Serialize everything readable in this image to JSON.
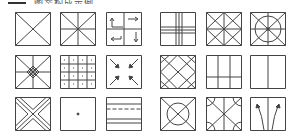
{
  "header": {
    "text": "图案构成示例"
  },
  "colors": {
    "stroke": "#444444",
    "background": "#ffffff"
  },
  "grid": {
    "rows": 3,
    "cols": 6,
    "cells": [
      {
        "icon": "square-diagonals-icon"
      },
      {
        "icon": "square-eight-division-icon"
      },
      {
        "icon": "square-quadrant-arrows-icon"
      },
      {
        "icon": "square-double-cross-lines-icon"
      },
      {
        "icon": "square-diamond-cross-icon"
      },
      {
        "icon": "square-circle-star-icon"
      },
      {
        "icon": "square-star-diamond-center-icon"
      },
      {
        "icon": "square-4x4-dotted-grid-icon"
      },
      {
        "icon": "square-corner-inward-arrows-icon"
      },
      {
        "icon": "square-lattice-diamonds-icon"
      },
      {
        "icon": "square-three-column-split-icon"
      },
      {
        "icon": "square-two-column-split-icon"
      },
      {
        "icon": "square-x-band-icon"
      },
      {
        "icon": "square-center-dot-icon"
      },
      {
        "icon": "square-horizontal-bands-dashed-icon"
      },
      {
        "icon": "square-circle-x-icon"
      },
      {
        "icon": "square-corner-arcs-icon"
      },
      {
        "icon": "square-diverging-arrows-icon"
      }
    ]
  }
}
